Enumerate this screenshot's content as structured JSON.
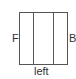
{
  "diagram": {
    "type": "three-panel box",
    "panels": 3,
    "labels": {
      "left_side": "F",
      "right_side": "B",
      "bottom": "left"
    },
    "colors": {
      "line": "#555555",
      "text": "#333333",
      "background": "#ffffff"
    }
  }
}
